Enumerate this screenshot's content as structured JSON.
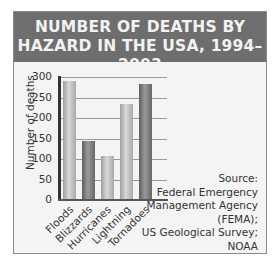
{
  "chart_data": {
    "type": "bar",
    "title": "NUMBER OF DEATHS BY HAZARD IN THE USA, 1994–2003",
    "title_lines": [
      "NUMBER OF DEATHS BY",
      "HAZARD IN THE USA, 1994–2003"
    ],
    "xlabel": "",
    "ylabel": "Number of deaths",
    "categories": [
      "Floods",
      "Blizzards",
      "Hurricanes",
      "Lightning",
      "Tornadoes"
    ],
    "values": [
      289,
      141,
      105,
      231,
      280
    ],
    "ylim": [
      0,
      300
    ],
    "yticks": [
      "0",
      "50",
      "100",
      "150",
      "200",
      "250",
      "300"
    ],
    "grid": true,
    "legend": null,
    "bar_colors": [
      "#c4c4c4",
      "#7a7a7a",
      "#c4c4c4",
      "#c4c4c4",
      "#7a7a7a"
    ],
    "annotations": {
      "source_lines": [
        "Source:",
        "Federal Emergency",
        "Management Agency",
        "(FEMA);",
        "US Geological Survey;",
        "NOAA"
      ]
    }
  },
  "colors": {
    "header_bg": "#6e6e6e",
    "header_text": "#f2f2f2",
    "panel_bg": "#f4f4f4"
  }
}
